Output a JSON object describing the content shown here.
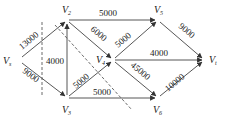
{
  "diagram": {
    "type": "directed-network-flow",
    "nodes": [
      {
        "id": "Vs",
        "label": "V",
        "sub": "s",
        "x": 17,
        "y": 60
      },
      {
        "id": "V2",
        "label": "V",
        "sub": "2",
        "x": 67,
        "y": 20
      },
      {
        "id": "V3",
        "label": "V",
        "sub": "3",
        "x": 67,
        "y": 98
      },
      {
        "id": "V4",
        "label": "V",
        "sub": "4",
        "x": 113,
        "y": 60
      },
      {
        "id": "V5",
        "label": "V",
        "sub": "5",
        "x": 158,
        "y": 20
      },
      {
        "id": "V6",
        "label": "V",
        "sub": "6",
        "x": 158,
        "y": 98
      },
      {
        "id": "Vt",
        "label": "V",
        "sub": "t",
        "x": 205,
        "y": 60
      }
    ],
    "edges": [
      {
        "from": "Vs",
        "to": "V2",
        "weight": "13000"
      },
      {
        "from": "Vs",
        "to": "V3",
        "weight": "9000"
      },
      {
        "from": "V3",
        "to": "V2",
        "weight": "4000"
      },
      {
        "from": "V2",
        "to": "V5",
        "weight": "5000"
      },
      {
        "from": "V2",
        "to": "V4",
        "weight": "6000"
      },
      {
        "from": "V3",
        "to": "V4",
        "weight": "5000"
      },
      {
        "from": "V3",
        "to": "V6",
        "weight": "5000"
      },
      {
        "from": "V4",
        "to": "V5",
        "weight": "5000"
      },
      {
        "from": "V4",
        "to": "Vt",
        "weight": "4000"
      },
      {
        "from": "V4",
        "to": "V6",
        "weight": "45000"
      },
      {
        "from": "V5",
        "to": "Vt",
        "weight": "9000"
      },
      {
        "from": "V6",
        "to": "Vt",
        "weight": "10000"
      }
    ]
  }
}
